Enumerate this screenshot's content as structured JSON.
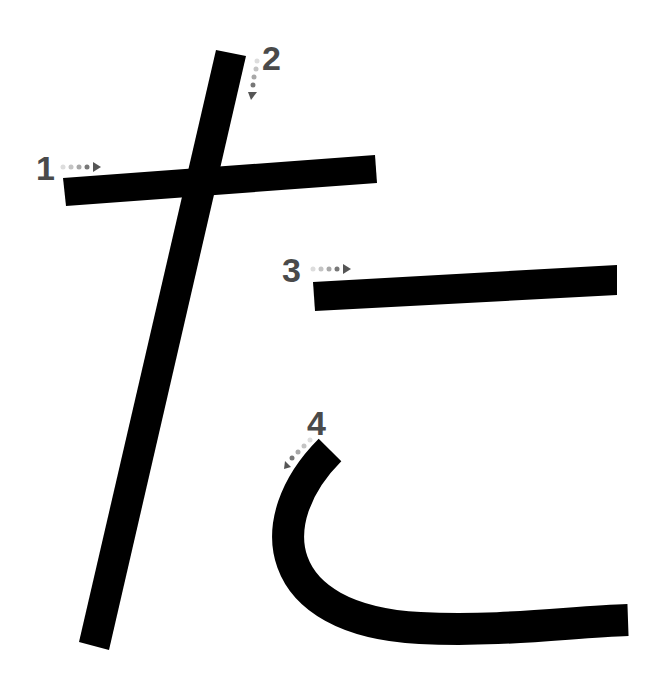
{
  "diagram": {
    "character": "た",
    "stroke_color": "#000000",
    "label_color": "#4a4a4a",
    "strokes": [
      {
        "order": "1",
        "label": "1",
        "direction": "right"
      },
      {
        "order": "2",
        "label": "2",
        "direction": "down"
      },
      {
        "order": "3",
        "label": "3",
        "direction": "right"
      },
      {
        "order": "4",
        "label": "4",
        "direction": "down-left"
      }
    ]
  }
}
